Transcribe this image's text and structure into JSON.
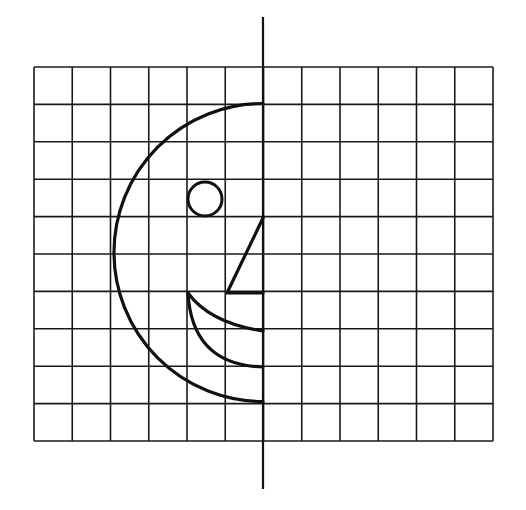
{
  "diagram": {
    "type": "symmetry-grid-drawing",
    "grid": {
      "columns": 12,
      "rows": 10,
      "x0": 34,
      "y0": 67,
      "cell_w": 38.25,
      "cell_h": 37.4,
      "color": "#1a1a1a"
    },
    "symmetry_line": {
      "x": 263,
      "y_top": 17,
      "y_bottom": 489
    },
    "shapes": {
      "head_arc": {
        "cx": 263,
        "cy": 252.5,
        "r": 149
      },
      "eye": {
        "cx": 205,
        "cy": 199,
        "r": 17
      },
      "nose": {
        "points": [
          [
            263,
            218
          ],
          [
            227,
            293
          ],
          [
            263,
            293
          ]
        ]
      },
      "mouth_upper": {
        "start": [
          188,
          293
        ],
        "end": [
          263,
          331
        ]
      },
      "mouth_lower": {
        "start": [
          188,
          293
        ],
        "end": [
          263,
          367
        ]
      }
    },
    "stroke_color": "#111111"
  }
}
